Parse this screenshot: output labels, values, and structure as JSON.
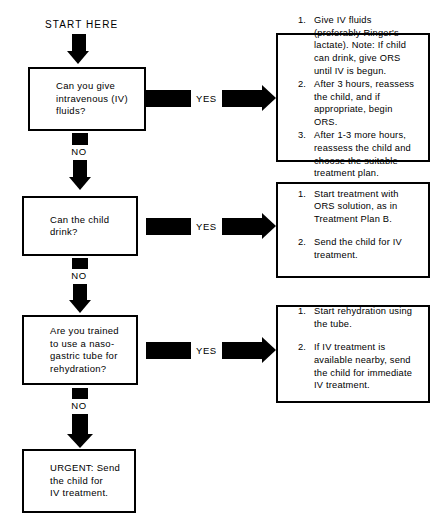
{
  "diagram": {
    "start_label": "START HERE",
    "yes_label": "YES",
    "no_label": "NO",
    "colors": {
      "ink": "#000000",
      "paper": "#ffffff"
    }
  },
  "decisions": [
    {
      "id": "iv-fluids",
      "text": "Can you give\nintravenous (IV)\nfluids?"
    },
    {
      "id": "child-drink",
      "text": "Can the child\ndrink?"
    },
    {
      "id": "nasogastric",
      "text": "Are you trained\nto use a naso-\ngastric tube for\nrehydration?"
    }
  ],
  "terminal": {
    "id": "urgent-referral",
    "text": "URGENT: Send\nthe child for\nIV treatment."
  },
  "outcomes": [
    {
      "id": "iv-fluids-outcome",
      "spaced": false,
      "items": [
        {
          "num": "1.",
          "text": "Give IV fluids (preferably Ringer's lactate). Note: If child can drink, give ORS until IV is begun."
        },
        {
          "num": "2.",
          "text": "After 3 hours, reassess the child, and if appropriate, begin ORS."
        },
        {
          "num": "3.",
          "text": "After 1-3 more hours, reassess the child and choose the suitable treatment plan."
        }
      ]
    },
    {
      "id": "child-drink-outcome",
      "spaced": true,
      "items": [
        {
          "num": "1.",
          "text": "Start treatment with ORS solution, as in Treatment Plan B."
        },
        {
          "num": "2.",
          "text": "Send the child for IV treatment."
        }
      ]
    },
    {
      "id": "nasogastric-outcome",
      "spaced": true,
      "items": [
        {
          "num": "1.",
          "text": "Start rehydration using the tube."
        },
        {
          "num": "2.",
          "text": "If IV treatment is available nearby, send the child for immediate IV treatment."
        }
      ]
    }
  ]
}
